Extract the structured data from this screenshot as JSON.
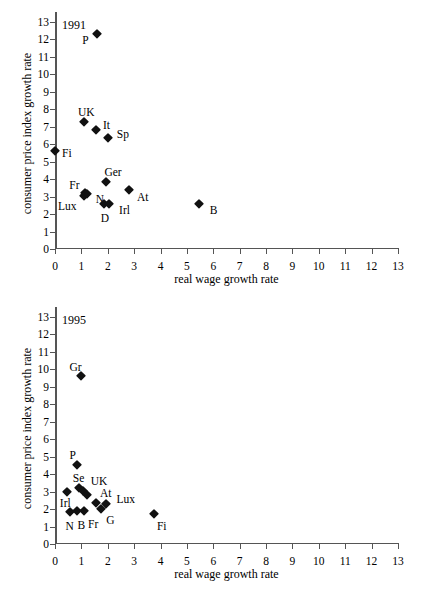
{
  "chart_data": [
    {
      "type": "scatter",
      "title": "1991",
      "xlabel": "real wage growth rate",
      "ylabel": "consumer price index growth rate",
      "xlim": [
        0,
        13
      ],
      "ylim": [
        0,
        13
      ],
      "xticks": [
        0,
        1,
        2,
        3,
        4,
        5,
        6,
        7,
        8,
        9,
        10,
        11,
        12,
        13
      ],
      "yticks": [
        0,
        1,
        2,
        3,
        4,
        5,
        6,
        7,
        8,
        9,
        10,
        11,
        12,
        13
      ],
      "grid": false,
      "legend": "none",
      "points": [
        {
          "label": "P",
          "x": 1.6,
          "y": 12.3,
          "lx": -15,
          "ly": 6
        },
        {
          "label": "UK",
          "x": 1.1,
          "y": 7.3,
          "lx": -6,
          "ly": -10
        },
        {
          "label": "It",
          "x": 1.55,
          "y": 6.8,
          "lx": 7,
          "ly": -5
        },
        {
          "label": "Sp",
          "x": 2.0,
          "y": 6.35,
          "lx": 9,
          "ly": -4
        },
        {
          "label": "Fi",
          "x": 0.0,
          "y": 5.6,
          "lx": 7,
          "ly": 2
        },
        {
          "label": "Ger",
          "x": 1.95,
          "y": 3.85,
          "lx": -2,
          "ly": -10
        },
        {
          "label": "Fr",
          "x": 1.15,
          "y": 3.2,
          "lx": -16,
          "ly": -8
        },
        {
          "label": "Lux",
          "x": 1.1,
          "y": 3.05,
          "lx": -26,
          "ly": 10
        },
        {
          "label": "N",
          "x": 1.2,
          "y": 3.15,
          "lx": 9,
          "ly": 5
        },
        {
          "label": "At",
          "x": 2.8,
          "y": 3.4,
          "lx": 8,
          "ly": 7
        },
        {
          "label": "D",
          "x": 1.85,
          "y": 2.55,
          "lx": -3,
          "ly": 14
        },
        {
          "label": "Irl",
          "x": 2.05,
          "y": 2.55,
          "lx": 10,
          "ly": 6
        },
        {
          "label": "B",
          "x": 5.45,
          "y": 2.55,
          "lx": 11,
          "ly": 6
        }
      ]
    },
    {
      "type": "scatter",
      "title": "1995",
      "xlabel": "real wage growth rate",
      "ylabel": "consumer price index growth rate",
      "xlim": [
        0,
        13
      ],
      "ylim": [
        0,
        13
      ],
      "xticks": [
        0,
        1,
        2,
        3,
        4,
        5,
        6,
        7,
        8,
        9,
        10,
        11,
        12,
        13
      ],
      "yticks": [
        0,
        1,
        2,
        3,
        4,
        5,
        6,
        7,
        8,
        9,
        10,
        11,
        12,
        13
      ],
      "grid": false,
      "legend": "none",
      "points": [
        {
          "label": "Gr",
          "x": 1.0,
          "y": 9.6,
          "lx": -12,
          "ly": -9
        },
        {
          "label": "P",
          "x": 0.85,
          "y": 4.5,
          "lx": -8,
          "ly": -10
        },
        {
          "label": "Se",
          "x": 0.9,
          "y": 3.2,
          "lx": -6,
          "ly": -10
        },
        {
          "label": "UK",
          "x": 1.05,
          "y": 3.05,
          "lx": 8,
          "ly": -10
        },
        {
          "label": "Irl",
          "x": 0.45,
          "y": 2.95,
          "lx": -7,
          "ly": 11
        },
        {
          "label": "Se2",
          "x": 1.2,
          "y": 2.8,
          "lx": 0,
          "ly": 0,
          "hide_label": true
        },
        {
          "label": "At",
          "x": 1.55,
          "y": 2.35,
          "lx": 4,
          "ly": -10
        },
        {
          "label": "Lux",
          "x": 1.95,
          "y": 2.3,
          "lx": 10,
          "ly": -5
        },
        {
          "label": "N",
          "x": 0.55,
          "y": 1.85,
          "lx": -4,
          "ly": 14
        },
        {
          "label": "B",
          "x": 0.85,
          "y": 1.9,
          "lx": 0,
          "ly": 14
        },
        {
          "label": "Fr",
          "x": 1.1,
          "y": 1.9,
          "lx": 4,
          "ly": 13
        },
        {
          "label": "G",
          "x": 1.75,
          "y": 2.0,
          "lx": 5,
          "ly": 11
        },
        {
          "label": "Fi",
          "x": 3.75,
          "y": 1.7,
          "lx": 3,
          "ly": 12
        }
      ]
    }
  ]
}
